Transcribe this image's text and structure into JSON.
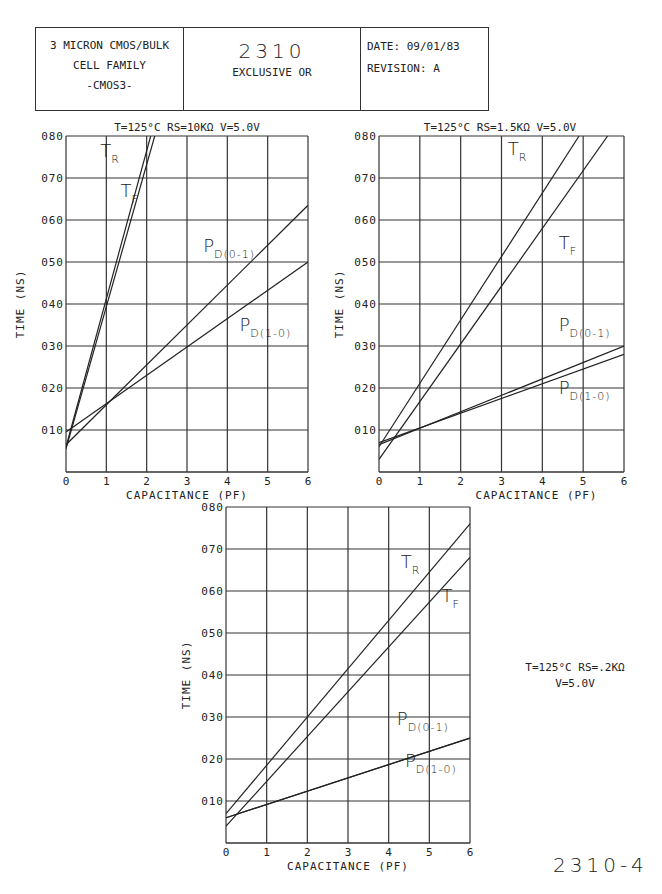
{
  "header": {
    "left_lines": [
      "3 MICRON CMOS/BULK",
      "CELL FAMILY",
      "-CMOS3-"
    ],
    "cell_number": "2310",
    "cell_name": "EXCLUSIVE OR",
    "date_label": "DATE: 09/01/83",
    "revision_label": "REVISION: A"
  },
  "side_note": {
    "line1": "T=125°C RS=.2KΩ",
    "line2": "V=5.0V"
  },
  "figure_number": "2310-4",
  "chart_data": [
    {
      "type": "line",
      "title": "T=125°C RS=10KΩ V=5.0V",
      "xlabel": "CAPACITANCE (PF)",
      "ylabel": "TIME (NS)",
      "xlim": [
        0,
        6
      ],
      "ylim": [
        0,
        0.8
      ],
      "xticks": [
        "0",
        "1",
        "2",
        "3",
        "4",
        "5",
        "6"
      ],
      "yticks": [
        "010",
        "020",
        "030",
        "040",
        "050",
        "060",
        "070",
        "080"
      ],
      "grid": true,
      "series": [
        {
          "name": "TR",
          "x": [
            0,
            2.1
          ],
          "y": [
            0.06,
            0.8
          ]
        },
        {
          "name": "TF",
          "x": [
            0,
            2.2
          ],
          "y": [
            0.055,
            0.8
          ]
        },
        {
          "name": "PD(0-1)",
          "x": [
            0,
            6
          ],
          "y": [
            0.065,
            0.635
          ]
        },
        {
          "name": "PD(1-0)",
          "x": [
            0,
            6
          ],
          "y": [
            0.095,
            0.5
          ]
        }
      ],
      "labels": [
        {
          "main": "T",
          "sub": "R",
          "x": 0.85,
          "y": 0.75
        },
        {
          "main": "T",
          "sub": "F",
          "x": 1.35,
          "y": 0.655
        },
        {
          "main": "P",
          "sub": "D(0-1)",
          "x": 3.4,
          "y": 0.525
        },
        {
          "main": "P",
          "sub": "D(1-0)",
          "x": 4.3,
          "y": 0.335
        }
      ]
    },
    {
      "type": "line",
      "title": "T=125°C RS=1.5KΩ V=5.0V",
      "xlabel": "CAPACITANCE (PF)",
      "ylabel": "TIME (NS)",
      "xlim": [
        0,
        6
      ],
      "ylim": [
        0,
        0.8
      ],
      "xticks": [
        "0",
        "1",
        "2",
        "3",
        "4",
        "5",
        "6"
      ],
      "yticks": [
        "010",
        "020",
        "030",
        "040",
        "050",
        "060",
        "070",
        "080"
      ],
      "grid": true,
      "series": [
        {
          "name": "TR",
          "x": [
            0,
            4.9
          ],
          "y": [
            0.06,
            0.8
          ]
        },
        {
          "name": "TF",
          "x": [
            0,
            5.6
          ],
          "y": [
            0.03,
            0.8
          ]
        },
        {
          "name": "PD(0-1)",
          "x": [
            0,
            6
          ],
          "y": [
            0.065,
            0.3
          ]
        },
        {
          "name": "PD(1-0)",
          "x": [
            0,
            6
          ],
          "y": [
            0.07,
            0.28
          ]
        }
      ],
      "labels": [
        {
          "main": "T",
          "sub": "R",
          "x": 3.15,
          "y": 0.755
        },
        {
          "main": "T",
          "sub": "F",
          "x": 4.4,
          "y": 0.53
        },
        {
          "main": "P",
          "sub": "D(0-1)",
          "x": 4.4,
          "y": 0.335
        },
        {
          "main": "P",
          "sub": "D(1-0)",
          "x": 4.4,
          "y": 0.185
        }
      ]
    },
    {
      "type": "line",
      "title": "T=125°C RS=.2KΩ V=5.0V",
      "xlabel": "CAPACITANCE (PF)",
      "ylabel": "TIME (NS)",
      "xlim": [
        0,
        6
      ],
      "ylim": [
        0,
        0.8
      ],
      "xticks": [
        "0",
        "1",
        "2",
        "3",
        "4",
        "5",
        "6"
      ],
      "yticks": [
        "010",
        "020",
        "030",
        "040",
        "050",
        "060",
        "070",
        "080"
      ],
      "grid": true,
      "series": [
        {
          "name": "TR",
          "x": [
            0,
            6
          ],
          "y": [
            0.07,
            0.76
          ]
        },
        {
          "name": "TF",
          "x": [
            0,
            6
          ],
          "y": [
            0.04,
            0.68
          ]
        },
        {
          "name": "PD(0-1)",
          "x": [
            0,
            6
          ],
          "y": [
            0.06,
            0.25
          ]
        },
        {
          "name": "PD(1-0)",
          "x": [
            0,
            6
          ],
          "y": [
            0.06,
            0.25
          ]
        }
      ],
      "labels": [
        {
          "main": "T",
          "sub": "R",
          "x": 4.3,
          "y": 0.655
        },
        {
          "main": "T",
          "sub": "F",
          "x": 5.3,
          "y": 0.575
        },
        {
          "main": "P",
          "sub": "D(0-1)",
          "x": 4.2,
          "y": 0.28
        },
        {
          "main": "P",
          "sub": "D(1-0)",
          "x": 4.4,
          "y": 0.18
        }
      ]
    }
  ]
}
